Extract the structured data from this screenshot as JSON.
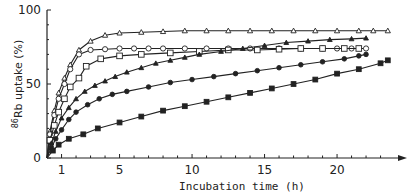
{
  "chart_data": {
    "type": "line",
    "title": "",
    "xlabel": "Incubation time (h)",
    "ylabel": "86Rb uptake (%)",
    "ylabel_superscript": "86",
    "ylabel_rest": "Rb uptake (%)",
    "xlim": [
      0,
      24
    ],
    "ylim": [
      0,
      100
    ],
    "x_ticks": [
      1,
      5,
      10,
      15,
      20
    ],
    "y_ticks": [
      0,
      50,
      100
    ],
    "grid": false,
    "legend": "none",
    "series": [
      {
        "name": "open-triangle",
        "marker": "triangle-open",
        "x": [
          0,
          0.2,
          0.5,
          0.8,
          1.2,
          1.6,
          2.2,
          3,
          4,
          5,
          6.5,
          8,
          9.5,
          11,
          12.5,
          14,
          15.5,
          17,
          18.5,
          20,
          21.5,
          22.5,
          23.5
        ],
        "y": [
          0,
          18,
          32,
          44,
          54,
          63,
          73,
          79,
          83,
          84.5,
          85,
          85.5,
          86,
          86,
          86,
          86,
          86,
          86,
          86,
          86,
          86,
          86,
          86
        ]
      },
      {
        "name": "open-circle",
        "marker": "circle-open",
        "x": [
          0,
          0.2,
          0.5,
          0.8,
          1.2,
          1.6,
          2.2,
          3,
          4,
          5,
          6,
          7,
          8,
          9.5,
          11,
          12.5,
          14,
          16,
          17.5,
          19,
          20,
          21,
          22
        ],
        "y": [
          0,
          16,
          29,
          40,
          50,
          60,
          70,
          73,
          73.5,
          74,
          74,
          74,
          74,
          74,
          74,
          74,
          74,
          74,
          74,
          74,
          74,
          74,
          74
        ]
      },
      {
        "name": "open-square",
        "marker": "square-open",
        "x": [
          0,
          0.2,
          0.5,
          0.8,
          1.2,
          1.6,
          2.2,
          2.7,
          3.7,
          5,
          6.5,
          8.5,
          10.5,
          12.5,
          14.5,
          16,
          17.5,
          19,
          20.5,
          21.5
        ],
        "y": [
          0,
          12,
          22,
          31,
          40,
          48,
          54,
          62,
          67,
          69,
          70,
          71,
          72,
          73,
          73,
          73.5,
          74,
          74,
          74,
          74
        ]
      },
      {
        "name": "filled-triangle",
        "marker": "triangle-filled",
        "x": [
          0,
          0.3,
          0.6,
          1,
          1.5,
          2,
          2.6,
          3.3,
          4,
          4.7,
          5.5,
          6.5,
          7.5,
          8.5,
          9.5,
          10.5,
          12,
          13.5,
          15,
          16.5,
          18,
          19.5,
          21,
          22
        ],
        "y": [
          0,
          10,
          18,
          27,
          34,
          40,
          45,
          49,
          52,
          55,
          58,
          61,
          64,
          66,
          68,
          70,
          72,
          74,
          76,
          78,
          79,
          80,
          80.5,
          81
        ]
      },
      {
        "name": "filled-circle",
        "marker": "circle-filled",
        "x": [
          0,
          0.3,
          0.6,
          1,
          1.5,
          2,
          2.8,
          3.6,
          4.5,
          5.5,
          7,
          8.5,
          10,
          11.5,
          13,
          14.5,
          16,
          17.5,
          19,
          20.5,
          21.5,
          22
        ],
        "y": [
          0,
          7,
          13,
          19,
          26,
          31,
          36,
          40,
          43,
          45,
          48,
          51,
          53,
          55,
          57,
          59,
          61,
          63,
          65,
          67,
          69,
          70
        ]
      },
      {
        "name": "filled-square",
        "marker": "square-filled",
        "x": [
          0,
          0.4,
          0.8,
          1.5,
          2.5,
          3.5,
          5,
          6.5,
          8,
          9.5,
          11,
          12.5,
          14,
          15.5,
          17,
          18.5,
          20,
          21.5,
          23,
          23.5
        ],
        "y": [
          0,
          5,
          9,
          13,
          16,
          20,
          24,
          28,
          32,
          35,
          38,
          41,
          44,
          47,
          50,
          53,
          57,
          60,
          64,
          66
        ]
      }
    ]
  }
}
